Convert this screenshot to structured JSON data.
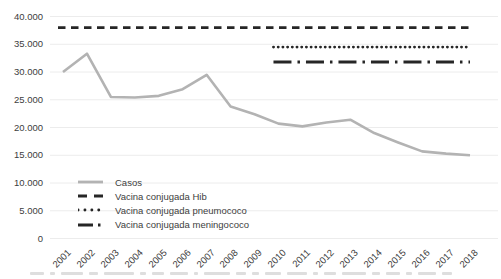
{
  "chart_data": {
    "type": "line",
    "title": "",
    "xlabel": "",
    "ylabel": "",
    "x": [
      2001,
      2002,
      2003,
      2004,
      2005,
      2006,
      2007,
      2008,
      2009,
      2010,
      2011,
      2012,
      2013,
      2014,
      2015,
      2016,
      2017,
      2018
    ],
    "x_tick_labels": [
      "2001",
      "2002",
      "2003",
      "2004",
      "2005",
      "2006",
      "2007",
      "2008",
      "2009",
      "2010",
      "2011",
      "2012",
      "2013",
      "2014",
      "2015",
      "2016",
      "2017",
      "2018"
    ],
    "ylim": [
      0,
      40000
    ],
    "ytick_step": 5000,
    "y_ticks": [
      {
        "value": 40000,
        "label": "40.000"
      },
      {
        "value": 35000,
        "label": "35.000"
      },
      {
        "value": 30000,
        "label": "30.000"
      },
      {
        "value": 25000,
        "label": "25.000"
      },
      {
        "value": 20000,
        "label": "20.000"
      },
      {
        "value": 15000,
        "label": "15.000"
      },
      {
        "value": 10000,
        "label": "10.000"
      },
      {
        "value": 5000,
        "label": "5.000"
      },
      {
        "value": 0,
        "label": "0"
      }
    ],
    "grid": "horizontal-only",
    "legend_position": "inside-bottom-left",
    "series": [
      {
        "name": "Casos",
        "style": "solid",
        "color": "#b3b3b3",
        "values": [
          30000,
          33300,
          25500,
          25400,
          25700,
          26900,
          29500,
          23800,
          22400,
          20700,
          20200,
          20900,
          21400,
          19000,
          17300,
          15700,
          15300,
          15000
        ]
      },
      {
        "name": "Vacina conjugada Hib",
        "style": "dashed",
        "color": "#262626",
        "constant_value": 38000,
        "x_start": 2001,
        "x_end": 2018
      },
      {
        "name": "Vacina conjugada pneumococo",
        "style": "dotted",
        "color": "#262626",
        "constant_value": 34500,
        "x_start": 2010,
        "x_end": 2018
      },
      {
        "name": "Vacina conjugada meningococo",
        "style": "dash-dot",
        "color": "#262626",
        "constant_value": 31800,
        "x_start": 2010,
        "x_end": 2018
      }
    ]
  },
  "legend": {
    "items": [
      {
        "label": "Casos",
        "style": "solid",
        "color": "#b3b3b3"
      },
      {
        "label": "Vacina conjugada Hib",
        "style": "dashed",
        "color": "#262626"
      },
      {
        "label": "Vacina conjugada pneumococo",
        "style": "dotted",
        "color": "#262626"
      },
      {
        "label": "Vacina conjugada meningococo",
        "style": "dash-dot",
        "color": "#262626"
      }
    ]
  },
  "colors": {
    "background": "#ffffff",
    "gridline": "#ececec",
    "axis_text": "#404040",
    "cases_line": "#b3b3b3",
    "vaccine_lines": "#262626"
  }
}
